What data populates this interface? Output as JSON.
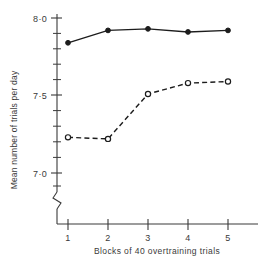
{
  "chart_data": {
    "type": "line",
    "title": "",
    "xlabel": "Blocks of 40 overtraining trials",
    "ylabel": "Mean number of trials per day",
    "x": [
      1,
      2,
      3,
      4,
      5
    ],
    "xticklabels": [
      "1",
      "2",
      "3",
      "4",
      "5"
    ],
    "yticklabels": [
      "8·0",
      "7·5",
      "7·0"
    ],
    "ytickvalues": [
      8.0,
      7.5,
      7.0
    ],
    "ylim": [
      6.95,
      8.05
    ],
    "xlim": [
      0.5,
      5.6
    ],
    "grid": false,
    "legend": "none",
    "axis_break": true,
    "series": [
      {
        "name": "solid-filled-circles",
        "marker": "filled-circle",
        "linestyle": "solid",
        "color": "#1c1c1c",
        "values": [
          7.84,
          7.92,
          7.93,
          7.91,
          7.92
        ]
      },
      {
        "name": "dashed-open-circles",
        "marker": "open-circle",
        "linestyle": "dashed",
        "color": "#1c1c1c",
        "values": [
          7.23,
          7.22,
          7.51,
          7.58,
          7.59
        ]
      }
    ]
  }
}
